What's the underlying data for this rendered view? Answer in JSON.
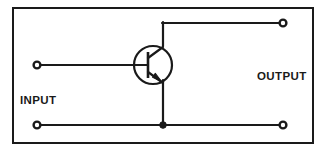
{
  "diagram": {
    "type": "schematic",
    "background_color": "#ffffff",
    "line_color": "#1a1a1a",
    "border": {
      "name": "diagram-frame",
      "x": 13,
      "y": 8,
      "width": 300,
      "height": 135,
      "stroke_width": 2
    },
    "labels": {
      "input": "INPUT",
      "output": "OUTPUT"
    },
    "label_positions": {
      "input": {
        "x": 20,
        "y": 104
      },
      "output": {
        "x": 257,
        "y": 80
      }
    },
    "component": {
      "kind": "npn-bipolar-transistor",
      "center_x": 153,
      "center_y": 65,
      "radius": 19,
      "base_bar_x": 148,
      "base_bar_top": 52,
      "base_bar_bottom": 78,
      "collector_x": 163,
      "emitter_x": 163
    },
    "terminals": [
      {
        "name": "input-positive-terminal",
        "label": "input-top",
        "cx": 37,
        "cy": 65,
        "r": 3.5
      },
      {
        "name": "input-negative-terminal",
        "label": "input-bottom",
        "cx": 37,
        "cy": 125,
        "r": 3.5
      },
      {
        "name": "output-positive-terminal",
        "label": "output-top",
        "cx": 283,
        "cy": 23,
        "r": 3.5
      },
      {
        "name": "output-negative-terminal",
        "label": "output-bottom",
        "cx": 283,
        "cy": 125,
        "r": 3.5
      }
    ],
    "junction": {
      "name": "emitter-ground-junction",
      "cx": 163,
      "cy": 125,
      "r": 3.2
    },
    "wires": [
      {
        "name": "base-input-wire",
        "points": "40,65 148,65"
      },
      {
        "name": "collector-up-wire",
        "points": "163,46 163,23"
      },
      {
        "name": "collector-output-wire",
        "points": "163,23 280,23"
      },
      {
        "name": "emitter-down-wire",
        "points": "163,80 163,125"
      },
      {
        "name": "bottom-rail-left-wire",
        "points": "40,125 163,125"
      },
      {
        "name": "bottom-rail-right-wire",
        "points": "163,125 280,125"
      }
    ]
  }
}
